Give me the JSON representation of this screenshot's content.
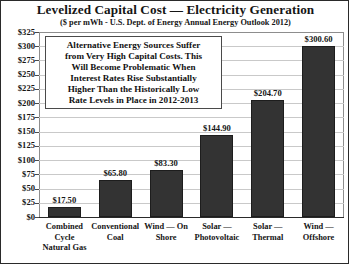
{
  "chart_data": {
    "type": "bar",
    "title": "Levelized Capital Cost — Electricity Generation",
    "subtitle": "($ per mWh - U.S. Dept. of Energy Annual Energy Outlook 2012)",
    "xlabel": "",
    "ylabel": "",
    "ylim": [
      0,
      325
    ],
    "ytick_step": 25,
    "grid": true,
    "legend": "none",
    "categories": [
      "Combined Cycle Natural Gas",
      "Conventional Coal",
      "Wind — On Shore",
      "Solar — Photovoltaic",
      "Solar — Thermal",
      "Wind — Offshore"
    ],
    "category_lines": [
      [
        "Combined",
        "Cycle",
        "Natural Gas"
      ],
      [
        "Conventional",
        "Coal"
      ],
      [
        "Wind — On",
        "Shore"
      ],
      [
        "Solar —",
        "Photovoltaic"
      ],
      [
        "Solar —",
        "Thermal"
      ],
      [
        "Wind —",
        "Offshore"
      ]
    ],
    "values": [
      17.5,
      65.8,
      83.3,
      144.9,
      204.7,
      300.6
    ],
    "value_labels": [
      "$17.50",
      "$65.80",
      "$83.30",
      "$144.90",
      "$204.70",
      "$300.60"
    ],
    "ytick_labels": [
      "$325",
      "$300",
      "$275",
      "$250",
      "$225",
      "$200",
      "$175",
      "$150",
      "$125",
      "$100",
      "$75",
      "$50",
      "$25",
      "$0"
    ],
    "ytick_values": [
      325,
      300,
      275,
      250,
      225,
      200,
      175,
      150,
      125,
      100,
      75,
      50,
      25,
      0
    ],
    "bar_color": "#333333",
    "gridline_color": "#c9c9c9",
    "text_color": "#151515"
  },
  "annotation": {
    "lines": [
      "Alternative Energy Sources Suffer",
      "from Very High Capital Costs. This",
      "Will Become Problematic When",
      "Interest Rates Rise Substantially",
      "Higher Than the Historically Low",
      "Rate Levels in Place in 2012-2013"
    ]
  }
}
